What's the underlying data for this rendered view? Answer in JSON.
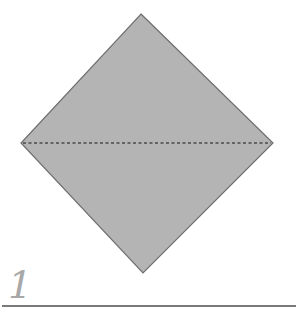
{
  "diagram": {
    "type": "origami-fold-step",
    "step_number": "1",
    "shape": {
      "kind": "diamond",
      "fill": "#b4b4b4",
      "stroke": "#6e6e6e",
      "vertices": {
        "top": [
          141,
          14
        ],
        "right": [
          273,
          143
        ],
        "bottom": [
          143,
          273
        ],
        "left": [
          21,
          143
        ]
      }
    },
    "fold_line": {
      "style": "dashed",
      "color": "#4a4a4a",
      "from": [
        21,
        143
      ],
      "to": [
        273,
        143
      ],
      "label": "valley fold (horizontal diagonal)"
    },
    "rule_color": "#7a7a7a"
  }
}
